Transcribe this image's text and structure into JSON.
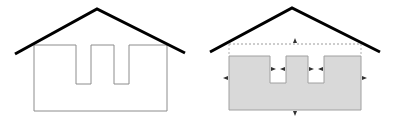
{
  "diagram": {
    "colors": {
      "roof": "#000000",
      "outline": "#8c8c8c",
      "fill": "#d9d9d9",
      "fill_stroke": "#a0a0a0",
      "dashed": "#9a9a9a",
      "arrow": "#333333",
      "background": "#ffffff"
    },
    "left_house": {
      "roof": [
        [
          15,
          54
        ],
        [
          97,
          9
        ],
        [
          185,
          53
        ]
      ],
      "body": [
        [
          34,
          45
        ],
        [
          76,
          45
        ],
        [
          76,
          84
        ],
        [
          91,
          84
        ],
        [
          91,
          45
        ],
        [
          114,
          45
        ],
        [
          114,
          84
        ],
        [
          129,
          84
        ],
        [
          129,
          45
        ],
        [
          167,
          45
        ],
        [
          167,
          111
        ],
        [
          34,
          111
        ]
      ]
    },
    "right_house": {
      "roof": [
        [
          210,
          52
        ],
        [
          292,
          8
        ],
        [
          380,
          52
        ]
      ],
      "dashed_top": [
        [
          229,
          44
        ],
        [
          361,
          44
        ]
      ],
      "body": [
        [
          229,
          56
        ],
        [
          270,
          56
        ],
        [
          270,
          83
        ],
        [
          286,
          83
        ],
        [
          286,
          56
        ],
        [
          308,
          56
        ],
        [
          308,
          83
        ],
        [
          324,
          83
        ],
        [
          324,
          56
        ],
        [
          361,
          56
        ],
        [
          361,
          110
        ],
        [
          229,
          110
        ]
      ],
      "arrows": [
        {
          "x": 295,
          "y": 41,
          "dir": "up"
        },
        {
          "x": 295,
          "y": 113,
          "dir": "down"
        },
        {
          "x": 226,
          "y": 78,
          "dir": "left"
        },
        {
          "x": 364,
          "y": 78,
          "dir": "right"
        },
        {
          "x": 273,
          "y": 69,
          "dir": "right"
        },
        {
          "x": 283,
          "y": 69,
          "dir": "left"
        },
        {
          "x": 311,
          "y": 69,
          "dir": "right"
        },
        {
          "x": 321,
          "y": 69,
          "dir": "left"
        }
      ]
    }
  }
}
